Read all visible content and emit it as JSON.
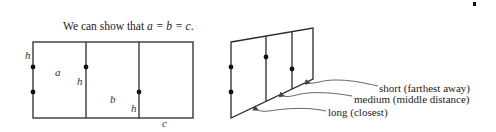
{
  "title": {
    "prefix": "We can show that ",
    "equation": "a = b = c",
    "suffix": "."
  },
  "left_diagram": {
    "labels": {
      "h_left": "h",
      "a": "a",
      "h_middle": "h",
      "b": "b",
      "h_right": "h",
      "c": "c"
    }
  },
  "right_diagram": {
    "annotations": [
      {
        "id": "short",
        "text": "short (farthest away)"
      },
      {
        "id": "medium",
        "text": "medium (middle distance)"
      },
      {
        "id": "long",
        "text": "long (closest)"
      }
    ]
  },
  "colors": {
    "line": "#2a2a2a",
    "dot": "#111111",
    "arrow": "#555555",
    "text": "#222222"
  }
}
